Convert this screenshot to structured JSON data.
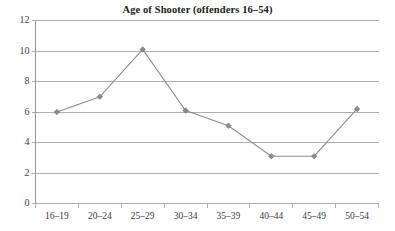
{
  "chart_data": {
    "type": "line",
    "title": "Age of Shooter (offenders 16–54)",
    "xlabel": "",
    "ylabel": "",
    "categories": [
      "16–19",
      "20–24",
      "25–29",
      "30–34",
      "35–39",
      "40–44",
      "45–49",
      "50–54"
    ],
    "values": [
      6.0,
      7.0,
      10.1,
      6.1,
      5.1,
      3.1,
      3.1,
      6.2
    ],
    "series": [
      {
        "name": "Age of Shooter",
        "values": [
          6.0,
          7.0,
          10.1,
          6.1,
          5.1,
          3.1,
          3.1,
          6.2
        ]
      }
    ],
    "ylim": [
      0,
      12
    ],
    "y_ticks": [
      0,
      2,
      4,
      6,
      8,
      10,
      12
    ],
    "y_tick_labels": [
      "0",
      "2",
      "4",
      "6",
      "8",
      "10",
      "12"
    ],
    "grid": true,
    "grid_axis": "y",
    "legend": false,
    "legend_position": "none",
    "marker": "diamond",
    "line_color": "#8c8c8c",
    "marker_color": "#8a8a8a",
    "grid_color": "#9a9a9a",
    "background_color": "#ffffff",
    "title_color": "#1a1a1a"
  }
}
